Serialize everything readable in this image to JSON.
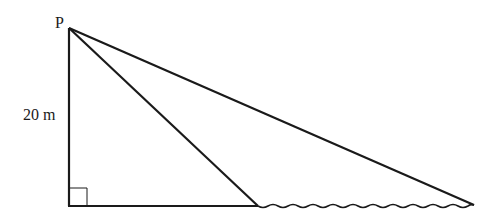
{
  "diagram": {
    "labels": {
      "point_top": "P",
      "height": "20 m"
    },
    "points": {
      "P": [
        69,
        28
      ],
      "foot": [
        69,
        206
      ],
      "near_point": [
        258,
        206
      ],
      "far_point": [
        474,
        205
      ]
    },
    "right_angle_marker": {
      "x": 69,
      "y": 188,
      "size": 18
    },
    "elements": [
      "vertical line P to foot (height 20 m)",
      "horizontal ground line from foot to near point",
      "line from P to near point",
      "line from P to far point",
      "wavy water surface from near point to far point",
      "right-angle marker at foot"
    ],
    "colors": {
      "stroke": "#1a1a1a",
      "background": "#ffffff"
    }
  }
}
